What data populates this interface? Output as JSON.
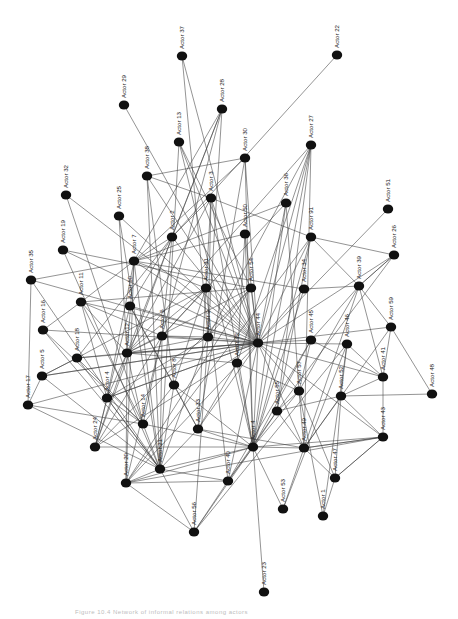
{
  "diagram": {
    "type": "directed-network",
    "node_color": "#111111",
    "edge_color": "#3a3a3a",
    "label_rotation": -90,
    "nodes": [
      {
        "id": "37",
        "label": "Actor 37",
        "x": 182,
        "y": 56
      },
      {
        "id": "22",
        "label": "Actor 22",
        "x": 337,
        "y": 55
      },
      {
        "id": "29",
        "label": "Actor 29",
        "x": 124,
        "y": 105
      },
      {
        "id": "28",
        "label": "Actor 28",
        "x": 222,
        "y": 109
      },
      {
        "id": "13",
        "label": "Actor 13",
        "x": 179,
        "y": 142
      },
      {
        "id": "30",
        "label": "Actor 30",
        "x": 245,
        "y": 158
      },
      {
        "id": "27",
        "label": "Actor 27",
        "x": 311,
        "y": 145
      },
      {
        "id": "38",
        "label": "Actor 38",
        "x": 147,
        "y": 176
      },
      {
        "id": "32",
        "label": "Actor 32",
        "x": 66,
        "y": 195
      },
      {
        "id": "3",
        "label": "Actor 3",
        "x": 211,
        "y": 198
      },
      {
        "id": "36",
        "label": "Actor 36",
        "x": 286,
        "y": 203
      },
      {
        "id": "51",
        "label": "Actor 51",
        "x": 388,
        "y": 209
      },
      {
        "id": "25",
        "label": "Actor 25",
        "x": 119,
        "y": 216
      },
      {
        "id": "2",
        "label": "Actor 2",
        "x": 172,
        "y": 237
      },
      {
        "id": "50",
        "label": "Actor 50",
        "x": 245,
        "y": 234
      },
      {
        "id": "91",
        "label": "Actor 91",
        "x": 311,
        "y": 237
      },
      {
        "id": "19",
        "label": "Actor 19",
        "x": 63,
        "y": 250
      },
      {
        "id": "26",
        "label": "Actor 26",
        "x": 394,
        "y": 255
      },
      {
        "id": "7",
        "label": "Actor 7",
        "x": 134,
        "y": 261
      },
      {
        "id": "35",
        "label": "Actor 35",
        "x": 31,
        "y": 280
      },
      {
        "id": "31",
        "label": "Actor 31",
        "x": 206,
        "y": 288
      },
      {
        "id": "54",
        "label": "Actor 54",
        "x": 251,
        "y": 288
      },
      {
        "id": "34",
        "label": "Actor 34",
        "x": 304,
        "y": 289
      },
      {
        "id": "39",
        "label": "Actor 39",
        "x": 359,
        "y": 286
      },
      {
        "id": "11",
        "label": "Actor 11",
        "x": 81,
        "y": 302
      },
      {
        "id": "10",
        "label": "Actor 10",
        "x": 130,
        "y": 306
      },
      {
        "id": "59",
        "label": "Actor 59",
        "x": 391,
        "y": 327
      },
      {
        "id": "16",
        "label": "Actor 16",
        "x": 43,
        "y": 330
      },
      {
        "id": "6",
        "label": "Actor 6",
        "x": 162,
        "y": 336
      },
      {
        "id": "9",
        "label": "Actor 9",
        "x": 208,
        "y": 337
      },
      {
        "id": "44",
        "label": "Actor 44",
        "x": 258,
        "y": 343
      },
      {
        "id": "45",
        "label": "Actor 45",
        "x": 311,
        "y": 340
      },
      {
        "id": "46",
        "label": "Actor 46",
        "x": 347,
        "y": 344
      },
      {
        "id": "18",
        "label": "Actor 18",
        "x": 77,
        "y": 358
      },
      {
        "id": "12",
        "label": "Actor 12",
        "x": 127,
        "y": 353
      },
      {
        "id": "5",
        "label": "Actor 5",
        "x": 42,
        "y": 376
      },
      {
        "id": "42",
        "label": "Actor 42",
        "x": 237,
        "y": 363
      },
      {
        "id": "41",
        "label": "Actor 41",
        "x": 383,
        "y": 377
      },
      {
        "id": "8",
        "label": "Actor 8",
        "x": 174,
        "y": 385
      },
      {
        "id": "57",
        "label": "Actor 57",
        "x": 299,
        "y": 391
      },
      {
        "id": "52",
        "label": "Actor 52",
        "x": 341,
        "y": 396
      },
      {
        "id": "48",
        "label": "Actor 48",
        "x": 432,
        "y": 394
      },
      {
        "id": "17",
        "label": "Actor 17",
        "x": 28,
        "y": 405
      },
      {
        "id": "4x",
        "label": "Actor 4",
        "x": 107,
        "y": 398
      },
      {
        "id": "24",
        "label": "Actor 24",
        "x": 95,
        "y": 447
      },
      {
        "id": "14",
        "label": "Actor 14",
        "x": 143,
        "y": 424
      },
      {
        "id": "33",
        "label": "Actor 33",
        "x": 198,
        "y": 429
      },
      {
        "id": "55",
        "label": "Actor 55",
        "x": 277,
        "y": 411
      },
      {
        "id": "43",
        "label": "Actor 43",
        "x": 383,
        "y": 437
      },
      {
        "id": "4",
        "label": "Actor 4",
        "x": 253,
        "y": 447
      },
      {
        "id": "49",
        "label": "Actor 49",
        "x": 304,
        "y": 448
      },
      {
        "id": "21",
        "label": "Actor 21",
        "x": 160,
        "y": 469
      },
      {
        "id": "20",
        "label": "Actor 20",
        "x": 126,
        "y": 483
      },
      {
        "id": "40",
        "label": "Actor 40",
        "x": 228,
        "y": 481
      },
      {
        "id": "47",
        "label": "Actor 47",
        "x": 335,
        "y": 478
      },
      {
        "id": "53",
        "label": "Actor 53",
        "x": 283,
        "y": 509
      },
      {
        "id": "1",
        "label": "Actor 1",
        "x": 323,
        "y": 516
      },
      {
        "id": "56",
        "label": "Actor 56",
        "x": 194,
        "y": 532
      },
      {
        "id": "23",
        "label": "Actor 23",
        "x": 264,
        "y": 592
      }
    ],
    "edges": [
      [
        "37",
        "9"
      ],
      [
        "37",
        "44"
      ],
      [
        "22",
        "2"
      ],
      [
        "29",
        "44"
      ],
      [
        "28",
        "7"
      ],
      [
        "28",
        "6"
      ],
      [
        "28",
        "12"
      ],
      [
        "28",
        "9"
      ],
      [
        "28",
        "2"
      ],
      [
        "13",
        "54"
      ],
      [
        "13",
        "44"
      ],
      [
        "13",
        "4"
      ],
      [
        "13",
        "21"
      ],
      [
        "30",
        "7"
      ],
      [
        "30",
        "44"
      ],
      [
        "30",
        "4"
      ],
      [
        "30",
        "33"
      ],
      [
        "30",
        "38"
      ],
      [
        "27",
        "12"
      ],
      [
        "27",
        "9"
      ],
      [
        "27",
        "44"
      ],
      [
        "27",
        "4"
      ],
      [
        "27",
        "55"
      ],
      [
        "27",
        "49"
      ],
      [
        "27",
        "42"
      ],
      [
        "38",
        "3"
      ],
      [
        "38",
        "8"
      ],
      [
        "38",
        "44"
      ],
      [
        "38",
        "21"
      ],
      [
        "32",
        "44"
      ],
      [
        "32",
        "14"
      ],
      [
        "3",
        "2"
      ],
      [
        "3",
        "9"
      ],
      [
        "3",
        "44"
      ],
      [
        "3",
        "33"
      ],
      [
        "3",
        "4"
      ],
      [
        "3",
        "12"
      ],
      [
        "3",
        "91"
      ],
      [
        "36",
        "6"
      ],
      [
        "36",
        "44"
      ],
      [
        "36",
        "4"
      ],
      [
        "36",
        "7"
      ],
      [
        "36",
        "57"
      ],
      [
        "51",
        "44"
      ],
      [
        "25",
        "44"
      ],
      [
        "25",
        "12"
      ],
      [
        "25",
        "21"
      ],
      [
        "2",
        "6"
      ],
      [
        "2",
        "44"
      ],
      [
        "2",
        "10"
      ],
      [
        "2",
        "18"
      ],
      [
        "2",
        "7"
      ],
      [
        "2",
        "24"
      ],
      [
        "50",
        "44"
      ],
      [
        "50",
        "42"
      ],
      [
        "50",
        "7"
      ],
      [
        "50",
        "4"
      ],
      [
        "91",
        "39"
      ],
      [
        "91",
        "44"
      ],
      [
        "91",
        "4"
      ],
      [
        "91",
        "55"
      ],
      [
        "91",
        "20"
      ],
      [
        "19",
        "54"
      ],
      [
        "19",
        "44"
      ],
      [
        "19",
        "21"
      ],
      [
        "26",
        "44"
      ],
      [
        "26",
        "55"
      ],
      [
        "26",
        "91"
      ],
      [
        "26",
        "39"
      ],
      [
        "7",
        "35"
      ],
      [
        "7",
        "11"
      ],
      [
        "7",
        "44"
      ],
      [
        "7",
        "31"
      ],
      [
        "7",
        "12"
      ],
      [
        "7",
        "4x"
      ],
      [
        "7",
        "21"
      ],
      [
        "7",
        "20"
      ],
      [
        "35",
        "44"
      ],
      [
        "35",
        "21"
      ],
      [
        "35",
        "17"
      ],
      [
        "31",
        "6"
      ],
      [
        "31",
        "44"
      ],
      [
        "31",
        "12"
      ],
      [
        "31",
        "18"
      ],
      [
        "31",
        "8"
      ],
      [
        "31",
        "40"
      ],
      [
        "54",
        "44"
      ],
      [
        "54",
        "9"
      ],
      [
        "54",
        "11"
      ],
      [
        "54",
        "12"
      ],
      [
        "54",
        "20"
      ],
      [
        "54",
        "24"
      ],
      [
        "34",
        "44"
      ],
      [
        "34",
        "39"
      ],
      [
        "34",
        "4"
      ],
      [
        "34",
        "7"
      ],
      [
        "39",
        "45"
      ],
      [
        "39",
        "41"
      ],
      [
        "39",
        "59"
      ],
      [
        "39",
        "57"
      ],
      [
        "39",
        "49"
      ],
      [
        "39",
        "26"
      ],
      [
        "11",
        "44"
      ],
      [
        "11",
        "6"
      ],
      [
        "11",
        "12"
      ],
      [
        "11",
        "14"
      ],
      [
        "11",
        "4x"
      ],
      [
        "10",
        "44"
      ],
      [
        "10",
        "33"
      ],
      [
        "10",
        "8"
      ],
      [
        "10",
        "24"
      ],
      [
        "59",
        "44"
      ],
      [
        "59",
        "48"
      ],
      [
        "59",
        "41"
      ],
      [
        "59",
        "49"
      ],
      [
        "16",
        "44"
      ],
      [
        "16",
        "21"
      ],
      [
        "16",
        "11"
      ],
      [
        "16",
        "14"
      ],
      [
        "6",
        "44"
      ],
      [
        "6",
        "9"
      ],
      [
        "6",
        "12"
      ],
      [
        "6",
        "14"
      ],
      [
        "6",
        "20"
      ],
      [
        "6",
        "24"
      ],
      [
        "6",
        "21"
      ],
      [
        "9",
        "44"
      ],
      [
        "9",
        "12"
      ],
      [
        "9",
        "21"
      ],
      [
        "9",
        "56"
      ],
      [
        "9",
        "4x"
      ],
      [
        "44",
        "45"
      ],
      [
        "44",
        "46"
      ],
      [
        "44",
        "41"
      ],
      [
        "44",
        "43"
      ],
      [
        "44",
        "4"
      ],
      [
        "44",
        "4x"
      ],
      [
        "44",
        "18"
      ],
      [
        "44",
        "5"
      ],
      [
        "44",
        "12"
      ],
      [
        "44",
        "57"
      ],
      [
        "44",
        "49"
      ],
      [
        "44",
        "33"
      ],
      [
        "44",
        "24"
      ],
      [
        "44",
        "20"
      ],
      [
        "44",
        "40"
      ],
      [
        "45",
        "41"
      ],
      [
        "45",
        "57"
      ],
      [
        "45",
        "4"
      ],
      [
        "45",
        "40"
      ],
      [
        "46",
        "41"
      ],
      [
        "46",
        "52"
      ],
      [
        "46",
        "53"
      ],
      [
        "46",
        "1"
      ],
      [
        "46",
        "56"
      ],
      [
        "18",
        "12"
      ],
      [
        "18",
        "5"
      ],
      [
        "18",
        "14"
      ],
      [
        "18",
        "21"
      ],
      [
        "12",
        "44"
      ],
      [
        "12",
        "42"
      ],
      [
        "12",
        "14"
      ],
      [
        "12",
        "24"
      ],
      [
        "12",
        "20"
      ],
      [
        "12",
        "4x"
      ],
      [
        "5",
        "44"
      ],
      [
        "5",
        "18"
      ],
      [
        "5",
        "17"
      ],
      [
        "5",
        "21"
      ],
      [
        "42",
        "57"
      ],
      [
        "42",
        "33"
      ],
      [
        "42",
        "4"
      ],
      [
        "41",
        "43"
      ],
      [
        "41",
        "52"
      ],
      [
        "8",
        "14"
      ],
      [
        "8",
        "21"
      ],
      [
        "8",
        "4"
      ],
      [
        "8",
        "33"
      ],
      [
        "57",
        "55"
      ],
      [
        "57",
        "49"
      ],
      [
        "57",
        "47"
      ],
      [
        "57",
        "4"
      ],
      [
        "57",
        "1"
      ],
      [
        "52",
        "48"
      ],
      [
        "52",
        "43"
      ],
      [
        "52",
        "47"
      ],
      [
        "52",
        "49"
      ],
      [
        "52",
        "55"
      ],
      [
        "17",
        "21"
      ],
      [
        "17",
        "44"
      ],
      [
        "17",
        "14"
      ],
      [
        "4x",
        "24"
      ],
      [
        "4x",
        "21"
      ],
      [
        "4x",
        "44"
      ],
      [
        "4x",
        "14"
      ],
      [
        "14",
        "21"
      ],
      [
        "14",
        "4"
      ],
      [
        "33",
        "21"
      ],
      [
        "33",
        "4"
      ],
      [
        "33",
        "49"
      ],
      [
        "55",
        "4"
      ],
      [
        "55",
        "49"
      ],
      [
        "55",
        "40"
      ],
      [
        "43",
        "4"
      ],
      [
        "43",
        "49"
      ],
      [
        "43",
        "20"
      ],
      [
        "43",
        "47"
      ],
      [
        "4",
        "49"
      ],
      [
        "4",
        "40"
      ],
      [
        "4",
        "56"
      ],
      [
        "4",
        "23"
      ],
      [
        "4",
        "53"
      ],
      [
        "4",
        "21"
      ],
      [
        "4",
        "20"
      ],
      [
        "4",
        "24"
      ],
      [
        "49",
        "47"
      ],
      [
        "49",
        "53"
      ],
      [
        "49",
        "43"
      ],
      [
        "40",
        "56"
      ],
      [
        "40",
        "21"
      ],
      [
        "40",
        "20"
      ],
      [
        "47",
        "1"
      ],
      [
        "47",
        "43"
      ],
      [
        "21",
        "20"
      ],
      [
        "21",
        "56"
      ],
      [
        "56",
        "20"
      ]
    ]
  },
  "caption": "Figure 10.4  Network of informal relations among actors"
}
